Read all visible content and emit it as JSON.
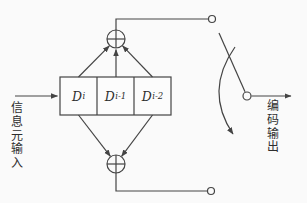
{
  "diagram": {
    "kind": "convolutional-encoder-block-diagram",
    "input_label": "信息元输入",
    "output_label": "编码输出",
    "registers": [
      {
        "base": "D",
        "sub": "i"
      },
      {
        "base": "D",
        "sub": "i-1"
      },
      {
        "base": "D",
        "sub": "i-2"
      }
    ],
    "colors": {
      "line": "#444444",
      "background": "#fafafa",
      "box_fill": "#fcfcfc",
      "text": "#2e2e2e"
    }
  }
}
